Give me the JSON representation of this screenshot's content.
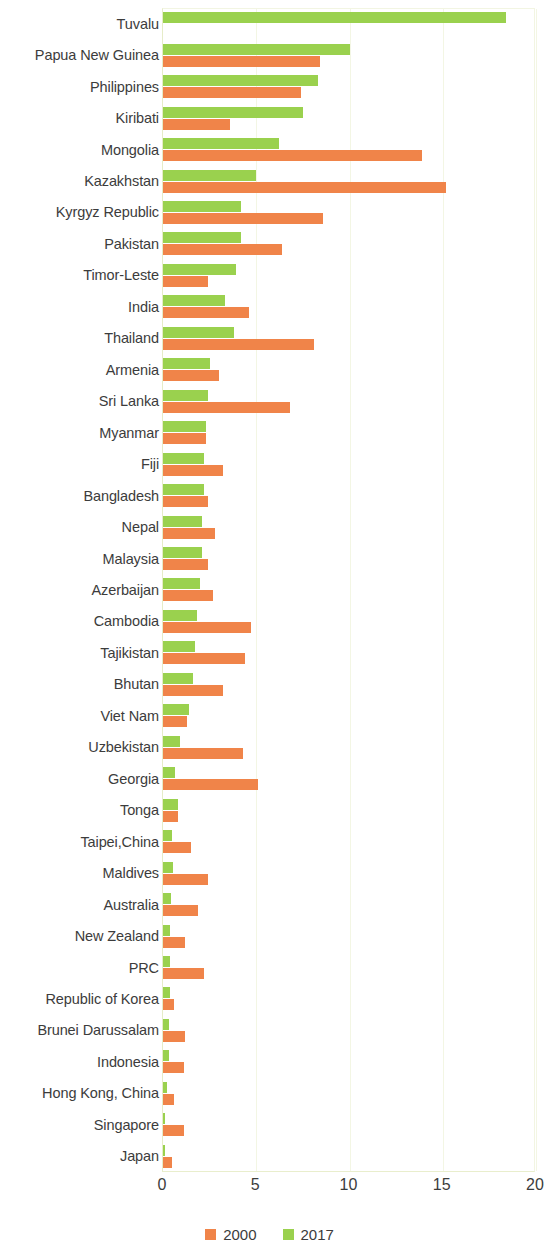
{
  "chart_data": {
    "type": "bar",
    "orientation": "horizontal",
    "title": "",
    "subtitle": "",
    "xlabel": "",
    "ylabel": "",
    "xlim": [
      0,
      20
    ],
    "xticks": [
      0,
      5,
      10,
      15,
      20
    ],
    "xtick_labels": [
      "0",
      "5",
      "10",
      "15",
      "20"
    ],
    "grid": true,
    "grid_axis": "x",
    "legend_position": "bottom",
    "categories": [
      "Tuvalu",
      "Papua New Guinea",
      "Philippines",
      "Kiribati",
      "Mongolia",
      "Kazakhstan",
      "Kyrgyz Republic",
      "Pakistan",
      "Timor-Leste",
      "India",
      "Thailand",
      "Armenia",
      "Sri Lanka",
      "Myanmar",
      "Fiji",
      "Bangladesh",
      "Nepal",
      "Malaysia",
      "Azerbaijan",
      "Cambodia",
      "Tajikistan",
      "Bhutan",
      "Viet Nam",
      "Uzbekistan",
      "Georgia",
      "Tonga",
      "Taipei,China",
      "Maldives",
      "Australia",
      "New Zealand",
      "PRC",
      "Republic of Korea",
      "Brunei Darussalam",
      "Indonesia",
      "Hong Kong, China",
      "Singapore",
      "Japan"
    ],
    "series": [
      {
        "name": "2000",
        "color": "#f08449",
        "values": [
          0.0,
          8.4,
          7.4,
          3.6,
          13.9,
          15.2,
          8.6,
          6.4,
          2.4,
          4.6,
          8.1,
          3.0,
          6.8,
          2.3,
          3.2,
          2.4,
          2.8,
          2.4,
          2.7,
          4.7,
          4.4,
          3.2,
          1.3,
          4.3,
          5.1,
          0.8,
          1.5,
          2.4,
          1.9,
          1.2,
          2.2,
          0.6,
          1.2,
          1.1,
          0.6,
          1.1,
          0.5
        ]
      },
      {
        "name": "2017",
        "color": "#9ad14e",
        "values": [
          18.4,
          10.0,
          8.3,
          7.5,
          6.2,
          5.0,
          4.2,
          4.2,
          3.9,
          3.3,
          3.8,
          2.5,
          2.4,
          2.3,
          2.2,
          2.2,
          2.1,
          2.1,
          2.0,
          1.8,
          1.7,
          1.6,
          1.4,
          0.9,
          0.65,
          0.8,
          0.5,
          0.55,
          0.45,
          0.35,
          0.4,
          0.35,
          0.3,
          0.3,
          0.2,
          0.1,
          0.1
        ]
      }
    ]
  },
  "legend": {
    "items": [
      {
        "label": "2000",
        "color": "#f08449"
      },
      {
        "label": "2017",
        "color": "#9ad14e"
      }
    ]
  },
  "colors": {
    "series_2000": "#f08449",
    "series_2017": "#9ad14e",
    "gridline": "#f3f6e4",
    "axis": "#e6ecc8",
    "text": "#3c3c3c"
  }
}
